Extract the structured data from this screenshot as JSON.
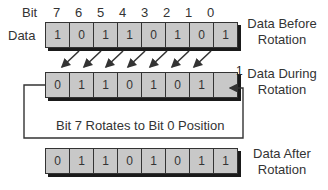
{
  "header": {
    "bit_label": "Bit",
    "data_label": "Data",
    "bit_numbers": [
      "7",
      "6",
      "5",
      "4",
      "3",
      "2",
      "1",
      "0"
    ]
  },
  "rows": {
    "before": {
      "label": "Data Before Rotation",
      "label_line1": "Data Before",
      "label_line2": "Rotation",
      "values": [
        "1",
        "0",
        "1",
        "1",
        "0",
        "1",
        "0",
        "1"
      ]
    },
    "during": {
      "label": "Data During Rotation",
      "label_line1": "Data During",
      "label_line2": "Rotation",
      "values": [
        "0",
        "1",
        "1",
        "0",
        "1",
        "0",
        "1",
        ""
      ],
      "carried_bit": "1"
    },
    "after": {
      "label": "Data After Rotation",
      "label_line1": "Data After",
      "label_line2": "Rotation",
      "values": [
        "0",
        "1",
        "1",
        "0",
        "1",
        "0",
        "1",
        "1"
      ]
    }
  },
  "loop_caption": "Bit 7 Rotates to Bit 0 Position",
  "colors": {
    "cell_fill": "#c8c8c8",
    "cell_border": "#333333",
    "shadow": "#1a1a1a",
    "line": "#333333"
  }
}
